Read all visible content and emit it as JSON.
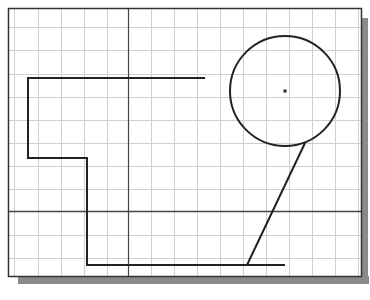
{
  "drawing": {
    "viewport": {
      "x": 8,
      "y": 8,
      "width": 353,
      "height": 268
    },
    "shadow": {
      "offset": 7,
      "color": "#8a8a8a"
    },
    "colors": {
      "background": "#ffffff",
      "grid": "#cfcfcf",
      "frame": "#333333",
      "geometry": "#222222",
      "crosshair": "#444444"
    },
    "grid": {
      "vertical_x": [
        14,
        38,
        61,
        84,
        107,
        151,
        174,
        197,
        220,
        243,
        266,
        289,
        312,
        335,
        358
      ],
      "horizontal_y": [
        27,
        50,
        74,
        97,
        120,
        143,
        166,
        189,
        235,
        258
      ]
    },
    "crosshair": {
      "x": 128,
      "y": 211
    },
    "polyline": {
      "points": [
        [
          205,
          78
        ],
        [
          28,
          78
        ],
        [
          28,
          158
        ],
        [
          87,
          158
        ],
        [
          87,
          265
        ],
        [
          285,
          265
        ]
      ]
    },
    "circle": {
      "cx": 285,
      "cy": 91,
      "r": 55,
      "center_mark": true
    },
    "slanted_line": {
      "x1": 305,
      "y1": 143,
      "x2": 247,
      "y2": 265
    }
  }
}
